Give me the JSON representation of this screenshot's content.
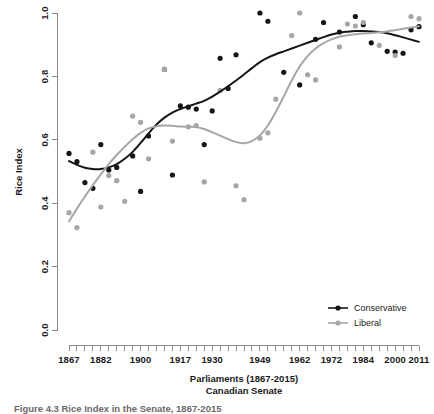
{
  "figure": {
    "caption": "Figure 4.3  Rice Index in the Senate, 1867-2015"
  },
  "chart_data": {
    "type": "scatter",
    "title": "",
    "xlabel": "Parliaments (1867-2015)",
    "xlabel_line2": "Canadian Senate",
    "ylabel": "Rice Index",
    "xlim": [
      1867,
      2015
    ],
    "ylim": [
      0.0,
      1.0
    ],
    "grid": false,
    "legend_position": "bottom-right",
    "y_ticks": [
      "0.0",
      "0.2",
      "0.4",
      "0.6",
      "0.8",
      "1.0"
    ],
    "y_tick_values": [
      0.0,
      0.2,
      0.4,
      0.6,
      0.8,
      1.0
    ],
    "x_tick_labels": [
      "1867",
      "1882",
      "1900",
      "1917",
      "1930",
      "1949",
      "1962",
      "1972",
      "1984",
      "2000",
      "2011"
    ],
    "x_tick_label_positions": [
      0,
      4,
      9,
      14,
      18,
      24,
      29,
      33,
      37,
      41,
      44
    ],
    "x_tick_count": 45,
    "colors": {
      "conservative": "#151515",
      "liberal": "#a6a6a6",
      "axis": "#8a8a8a",
      "background": "#ffffff"
    },
    "series": [
      {
        "name": "Conservative",
        "color": "#151515",
        "points": [
          {
            "x": 0,
            "y": 0.557
          },
          {
            "x": 1,
            "y": 0.531
          },
          {
            "x": 2,
            "y": 0.465
          },
          {
            "x": 3,
            "y": 0.447
          },
          {
            "x": 4,
            "y": 0.585
          },
          {
            "x": 5,
            "y": 0.505
          },
          {
            "x": 6,
            "y": 0.513
          },
          {
            "x": 8,
            "y": 0.549
          },
          {
            "x": 9,
            "y": 0.437
          },
          {
            "x": 10,
            "y": 0.612
          },
          {
            "x": 12,
            "y": 0.822
          },
          {
            "x": 13,
            "y": 0.489
          },
          {
            "x": 14,
            "y": 0.707
          },
          {
            "x": 15,
            "y": 0.703
          },
          {
            "x": 16,
            "y": 0.697
          },
          {
            "x": 17,
            "y": 0.585
          },
          {
            "x": 18,
            "y": 0.691
          },
          {
            "x": 19,
            "y": 0.857
          },
          {
            "x": 20,
            "y": 0.762
          },
          {
            "x": 21,
            "y": 0.868
          },
          {
            "x": 24,
            "y": 1.0
          },
          {
            "x": 25,
            "y": 0.974
          },
          {
            "x": 27,
            "y": 0.813
          },
          {
            "x": 29,
            "y": 0.773
          },
          {
            "x": 31,
            "y": 0.917
          },
          {
            "x": 32,
            "y": 0.97
          },
          {
            "x": 34,
            "y": 0.94
          },
          {
            "x": 36,
            "y": 0.989
          },
          {
            "x": 37,
            "y": 0.963
          },
          {
            "x": 38,
            "y": 0.906
          },
          {
            "x": 40,
            "y": 0.879
          },
          {
            "x": 41,
            "y": 0.877
          },
          {
            "x": 42,
            "y": 0.873
          },
          {
            "x": 43,
            "y": 0.947
          },
          {
            "x": 44,
            "y": 0.957
          }
        ]
      },
      {
        "name": "Liberal",
        "color": "#a6a6a6",
        "points": [
          {
            "x": 0,
            "y": 0.37
          },
          {
            "x": 1,
            "y": 0.323
          },
          {
            "x": 3,
            "y": 0.561
          },
          {
            "x": 4,
            "y": 0.388
          },
          {
            "x": 5,
            "y": 0.487
          },
          {
            "x": 6,
            "y": 0.471
          },
          {
            "x": 7,
            "y": 0.406
          },
          {
            "x": 8,
            "y": 0.675
          },
          {
            "x": 9,
            "y": 0.655
          },
          {
            "x": 10,
            "y": 0.54
          },
          {
            "x": 12,
            "y": 0.822
          },
          {
            "x": 13,
            "y": 0.596
          },
          {
            "x": 15,
            "y": 0.641
          },
          {
            "x": 16,
            "y": 0.645
          },
          {
            "x": 17,
            "y": 0.467
          },
          {
            "x": 19,
            "y": 0.756
          },
          {
            "x": 21,
            "y": 0.455
          },
          {
            "x": 22,
            "y": 0.411
          },
          {
            "x": 24,
            "y": 0.605
          },
          {
            "x": 25,
            "y": 0.622
          },
          {
            "x": 26,
            "y": 0.728
          },
          {
            "x": 28,
            "y": 0.929
          },
          {
            "x": 29,
            "y": 1.0
          },
          {
            "x": 30,
            "y": 0.805
          },
          {
            "x": 31,
            "y": 0.789
          },
          {
            "x": 34,
            "y": 0.893
          },
          {
            "x": 35,
            "y": 0.965
          },
          {
            "x": 36,
            "y": 0.959
          },
          {
            "x": 37,
            "y": 0.97
          },
          {
            "x": 39,
            "y": 0.898
          },
          {
            "x": 41,
            "y": 0.866
          },
          {
            "x": 43,
            "y": 0.989
          },
          {
            "x": 44,
            "y": 0.982
          }
        ]
      }
    ],
    "smoothers": [
      {
        "name": "Conservative",
        "color": "#151515",
        "values": [
          {
            "x": 0,
            "y": 0.533
          },
          {
            "x": 1,
            "y": 0.521
          },
          {
            "x": 2,
            "y": 0.512
          },
          {
            "x": 3,
            "y": 0.508
          },
          {
            "x": 4,
            "y": 0.508
          },
          {
            "x": 5,
            "y": 0.513
          },
          {
            "x": 6,
            "y": 0.523
          },
          {
            "x": 7,
            "y": 0.54
          },
          {
            "x": 8,
            "y": 0.562
          },
          {
            "x": 9,
            "y": 0.59
          },
          {
            "x": 10,
            "y": 0.62
          },
          {
            "x": 11,
            "y": 0.648
          },
          {
            "x": 12,
            "y": 0.67
          },
          {
            "x": 13,
            "y": 0.686
          },
          {
            "x": 14,
            "y": 0.697
          },
          {
            "x": 15,
            "y": 0.706
          },
          {
            "x": 16,
            "y": 0.714
          },
          {
            "x": 17,
            "y": 0.723
          },
          {
            "x": 18,
            "y": 0.736
          },
          {
            "x": 19,
            "y": 0.752
          },
          {
            "x": 20,
            "y": 0.769
          },
          {
            "x": 21,
            "y": 0.787
          },
          {
            "x": 22,
            "y": 0.806
          },
          {
            "x": 23,
            "y": 0.826
          },
          {
            "x": 24,
            "y": 0.845
          },
          {
            "x": 25,
            "y": 0.859
          },
          {
            "x": 26,
            "y": 0.87
          },
          {
            "x": 27,
            "y": 0.879
          },
          {
            "x": 28,
            "y": 0.888
          },
          {
            "x": 29,
            "y": 0.897
          },
          {
            "x": 30,
            "y": 0.906
          },
          {
            "x": 31,
            "y": 0.915
          },
          {
            "x": 32,
            "y": 0.924
          },
          {
            "x": 33,
            "y": 0.932
          },
          {
            "x": 34,
            "y": 0.938
          },
          {
            "x": 35,
            "y": 0.941
          },
          {
            "x": 36,
            "y": 0.943
          },
          {
            "x": 37,
            "y": 0.943
          },
          {
            "x": 38,
            "y": 0.942
          },
          {
            "x": 39,
            "y": 0.94
          },
          {
            "x": 40,
            "y": 0.936
          },
          {
            "x": 41,
            "y": 0.93
          },
          {
            "x": 42,
            "y": 0.923
          },
          {
            "x": 43,
            "y": 0.916
          },
          {
            "x": 44,
            "y": 0.909
          }
        ]
      },
      {
        "name": "Liberal",
        "color": "#a6a6a6",
        "values": [
          {
            "x": 0,
            "y": 0.343
          },
          {
            "x": 1,
            "y": 0.383
          },
          {
            "x": 2,
            "y": 0.421
          },
          {
            "x": 3,
            "y": 0.457
          },
          {
            "x": 4,
            "y": 0.491
          },
          {
            "x": 5,
            "y": 0.523
          },
          {
            "x": 6,
            "y": 0.552
          },
          {
            "x": 7,
            "y": 0.578
          },
          {
            "x": 8,
            "y": 0.602
          },
          {
            "x": 9,
            "y": 0.622
          },
          {
            "x": 10,
            "y": 0.636
          },
          {
            "x": 11,
            "y": 0.643
          },
          {
            "x": 12,
            "y": 0.645
          },
          {
            "x": 13,
            "y": 0.644
          },
          {
            "x": 14,
            "y": 0.642
          },
          {
            "x": 15,
            "y": 0.641
          },
          {
            "x": 16,
            "y": 0.64
          },
          {
            "x": 17,
            "y": 0.634
          },
          {
            "x": 18,
            "y": 0.624
          },
          {
            "x": 19,
            "y": 0.613
          },
          {
            "x": 20,
            "y": 0.602
          },
          {
            "x": 21,
            "y": 0.593
          },
          {
            "x": 22,
            "y": 0.589
          },
          {
            "x": 23,
            "y": 0.596
          },
          {
            "x": 24,
            "y": 0.614
          },
          {
            "x": 25,
            "y": 0.645
          },
          {
            "x": 26,
            "y": 0.688
          },
          {
            "x": 27,
            "y": 0.737
          },
          {
            "x": 28,
            "y": 0.787
          },
          {
            "x": 29,
            "y": 0.831
          },
          {
            "x": 30,
            "y": 0.864
          },
          {
            "x": 31,
            "y": 0.888
          },
          {
            "x": 32,
            "y": 0.905
          },
          {
            "x": 33,
            "y": 0.917
          },
          {
            "x": 34,
            "y": 0.925
          },
          {
            "x": 35,
            "y": 0.93
          },
          {
            "x": 36,
            "y": 0.933
          },
          {
            "x": 37,
            "y": 0.935
          },
          {
            "x": 38,
            "y": 0.937
          },
          {
            "x": 39,
            "y": 0.939
          },
          {
            "x": 40,
            "y": 0.942
          },
          {
            "x": 41,
            "y": 0.946
          },
          {
            "x": 42,
            "y": 0.95
          },
          {
            "x": 43,
            "y": 0.954
          },
          {
            "x": 44,
            "y": 0.958
          }
        ]
      }
    ],
    "legend": [
      {
        "label": "Conservative",
        "color": "#151515"
      },
      {
        "label": "Liberal",
        "color": "#a6a6a6"
      }
    ]
  }
}
